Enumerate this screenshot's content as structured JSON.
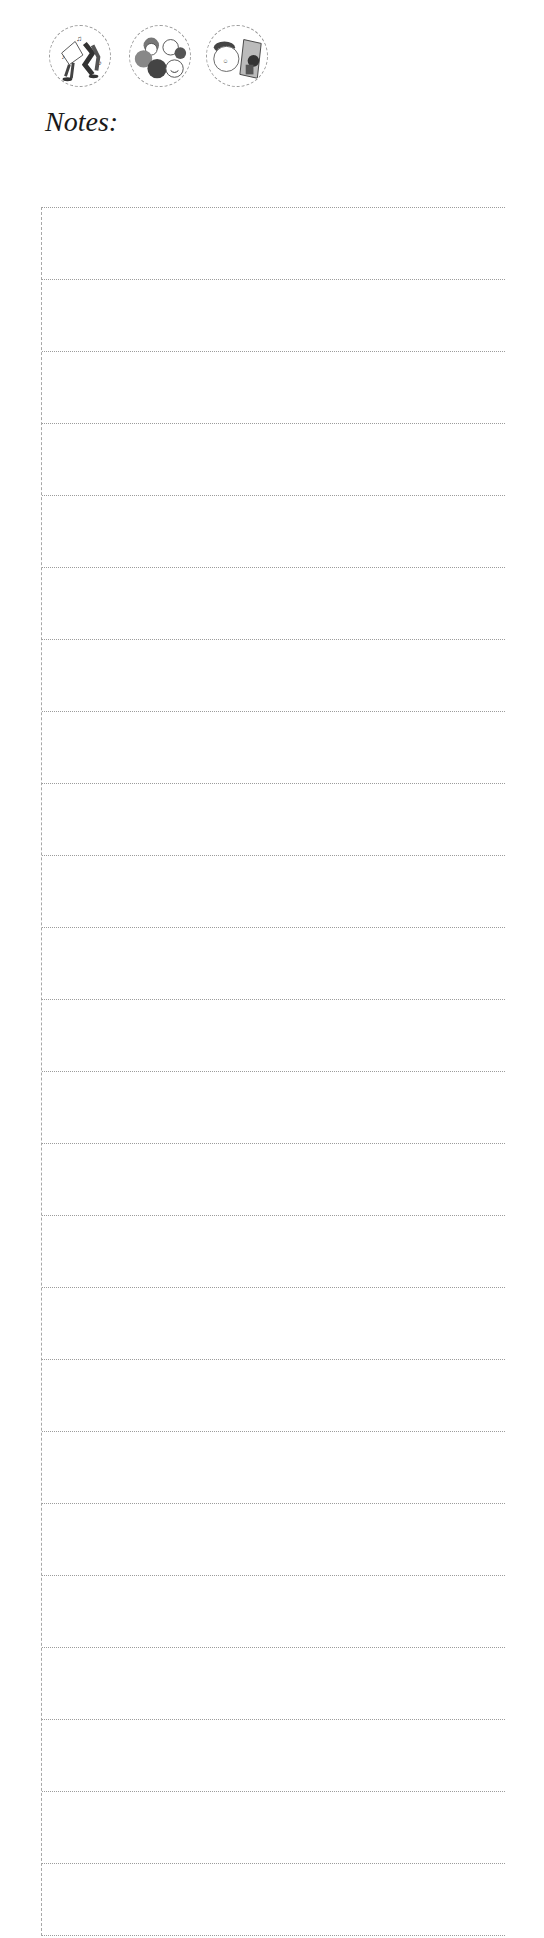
{
  "header": {
    "icons": [
      {
        "name": "dancing-music-icon",
        "description": "dancing figures with music notes"
      },
      {
        "name": "group-of-people-icon",
        "description": "group of smiling people"
      },
      {
        "name": "artist-painting-icon",
        "description": "person with beret and picture frame"
      }
    ]
  },
  "notes": {
    "title": "Notes:",
    "line_count": 25
  },
  "colors": {
    "rule": "#9c9c9c",
    "text": "#1a1a1a",
    "background": "#ffffff"
  }
}
